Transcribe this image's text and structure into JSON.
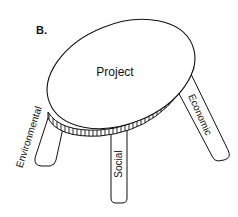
{
  "figure": {
    "panel_label": "B.",
    "top_label": "Project",
    "legs": [
      {
        "id": "environmental",
        "label": "Environmental"
      },
      {
        "id": "social",
        "label": "Social"
      },
      {
        "id": "economic",
        "label": "Economic"
      }
    ]
  },
  "colors": {
    "stroke": "#111111",
    "background": "#ffffff"
  }
}
